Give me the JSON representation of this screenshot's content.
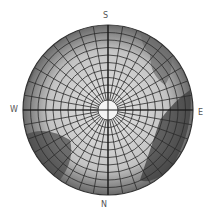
{
  "map": {
    "type": "polar-projection-globe",
    "center": [
      108,
      110
    ],
    "radius": 85,
    "pole_cap_radius": 10,
    "rings": 9,
    "meridians": 36,
    "colors": {
      "background": "#ffffff",
      "globe_light": "#d6d6d6",
      "globe_dark": "#4a4a4a",
      "grid": "#2b2b2b",
      "pole_cap": "#f4f4f4"
    }
  },
  "labels": {
    "top": "S",
    "bottom": "N",
    "left": "W",
    "right": "E"
  }
}
